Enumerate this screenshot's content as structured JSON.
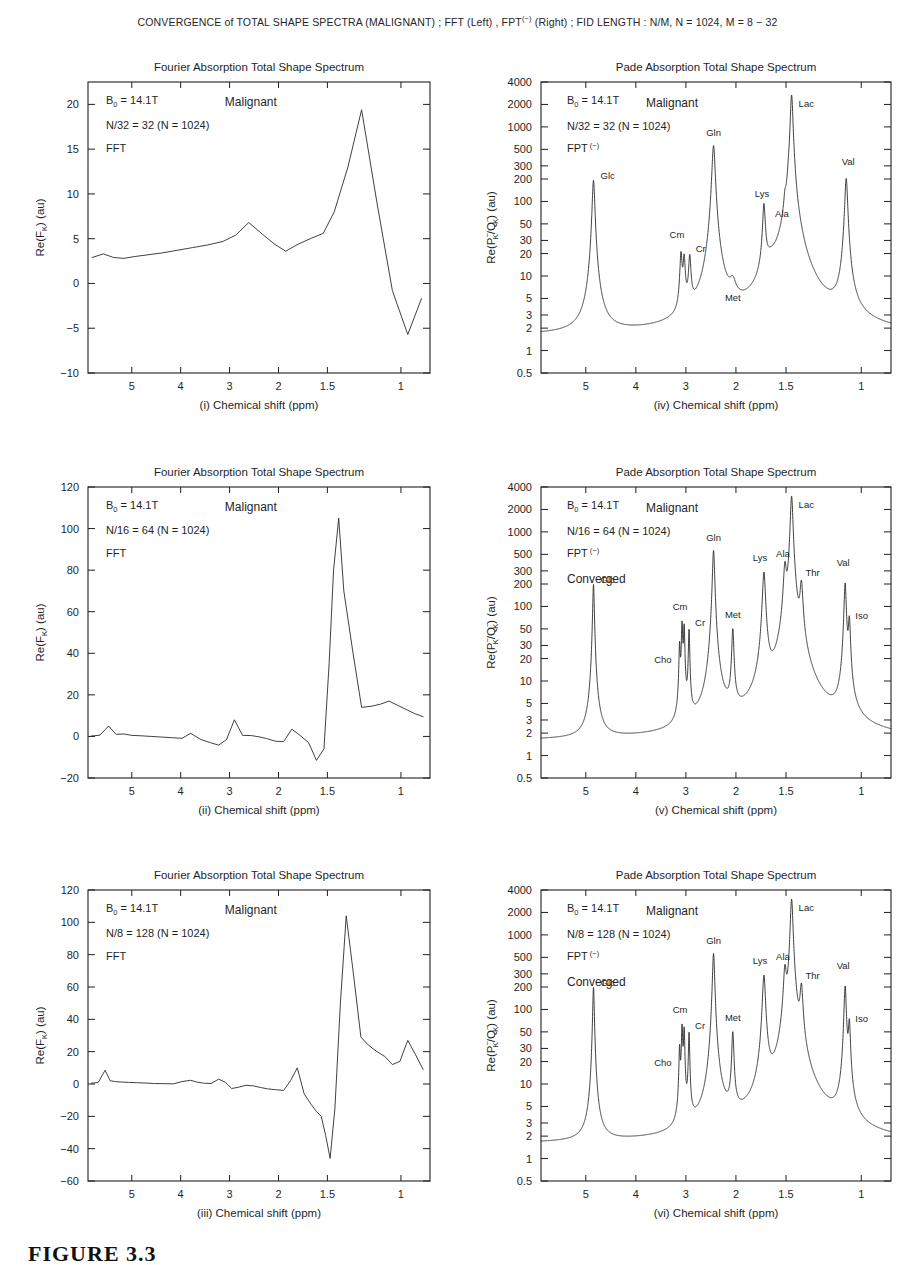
{
  "figure": {
    "suptitle_parts": {
      "a": "CONVERGENCE of TOTAL SHAPE SPECTRA (MALIGNANT) ;  FFT (Left) ,  FPT",
      "sup": "(−)",
      "b": " (Right) ;  FID LENGTH : N/M, N = 1024, M = 8 − 32"
    },
    "suptitle_plain": "CONVERGENCE of TOTAL SHAPE SPECTRA (MALIGNANT) ; FFT (Left) , FPT(-) (Right) ; FID LENGTH : N/M, N = 1024, M = 8 - 32",
    "caption": "FIGURE 3.3"
  },
  "common": {
    "fft_title": "Fourier Absorption Total Shape Spectrum",
    "pade_title": "Pade Absorption Total Shape Spectrum",
    "xlabel_tail": "Chemical shift (ppm)",
    "field_label": "B",
    "field_sub": "0",
    "field_value": " = 14.1T",
    "tissue": "Malignant",
    "fft_method": "FFT",
    "pade_method": "FPT",
    "pade_method_sup": "(−)",
    "converged": "Converged",
    "fft_ylabel_main": "Re(F",
    "fft_ylabel_sub": "K",
    "fft_ylabel_tail": ") (au)",
    "pade_ylabel_p": "Re(P",
    "pade_ylabel_psub": "K",
    "pade_ylabel_psup": "−",
    "pade_ylabel_q": "/Q",
    "pade_ylabel_qsub": "K",
    "pade_ylabel_qsup": "−",
    "pade_ylabel_tail": ") (au)",
    "xticks": [
      5,
      4,
      3,
      2,
      1.5,
      1
    ],
    "xtick_labels": [
      "5",
      "4",
      "3",
      "2",
      "1.5",
      "1"
    ],
    "xtick_pos": [
      0.128,
      0.271,
      0.414,
      0.557,
      0.7,
      0.915
    ],
    "pade_yticks": [
      4000,
      2000,
      1000,
      500,
      300,
      200,
      100,
      50,
      30,
      20,
      10,
      5,
      3,
      2,
      1,
      0.5
    ],
    "pade_ytick_labels": [
      "4000",
      "2000",
      "1000",
      "500",
      "300",
      "200",
      "100",
      "50",
      "30",
      "20",
      "10",
      "5",
      "3",
      "2",
      "1",
      "0.5"
    ]
  },
  "chart_data": [
    {
      "id": "i",
      "panel_index": "(i)",
      "type": "line",
      "side": "left",
      "title": "Fourier Absorption Total Shape Spectrum",
      "xlabel": "(i)  Chemical shift (ppm)",
      "ylabel": "Re(F_K) (au)",
      "grid": false,
      "legend": false,
      "annotations": [
        "B_0 = 14.1T",
        "Malignant",
        "N/32 = 32 (N = 1024)",
        "FFT"
      ],
      "fid_label": "N/32 = 32 (N = 1024)",
      "ylim": [
        -10,
        22.5
      ],
      "yticks": [
        -10,
        -5,
        0,
        5,
        10,
        15,
        20
      ],
      "ytick_labels": [
        "-10",
        "-5",
        "0",
        "5",
        "10",
        "15",
        "20"
      ],
      "xlim_frac": [
        0,
        1
      ],
      "points_xfrac": [
        0.012,
        0.045,
        0.075,
        0.105,
        0.135,
        0.175,
        0.215,
        0.26,
        0.305,
        0.35,
        0.395,
        0.432,
        0.47,
        0.51,
        0.545,
        0.578,
        0.615,
        0.65,
        0.688,
        0.72,
        0.76,
        0.8,
        0.845,
        0.89,
        0.935,
        0.975
      ],
      "points_y": [
        2.9,
        3.3,
        2.9,
        2.8,
        3.0,
        3.2,
        3.4,
        3.7,
        4.0,
        4.3,
        4.7,
        5.4,
        6.8,
        5.5,
        4.4,
        3.6,
        4.4,
        5.0,
        5.6,
        8.0,
        13.0,
        19.4,
        9.0,
        -0.8,
        -5.7,
        -1.7
      ]
    },
    {
      "id": "iv",
      "panel_index": "(iv)",
      "type": "line",
      "side": "right",
      "scale": "log",
      "title": "Pade Absorption Total Shape Spectrum",
      "xlabel": "(iv)  Chemical shift (ppm)",
      "ylabel": "Re(P-_K/Q-_K) (au)",
      "grid": false,
      "legend": false,
      "annotations": [
        "B_0 = 14.1T",
        "Malignant",
        "N/32 = 32 (N = 1024)",
        "FPT(-)"
      ],
      "fid_label": "N/32 = 32 (N = 1024)",
      "converged": false,
      "ylim": [
        0.5,
        4000
      ],
      "baseline": 1.55,
      "peaks": [
        {
          "name": "Glc",
          "xfrac": 0.15,
          "height": 190,
          "width": 0.0035,
          "label_dx": 7,
          "label_dy": -2,
          "label_anchor": "start"
        },
        {
          "name": "Cm",
          "xfrac": 0.4,
          "height": 16.5,
          "width": 0.003,
          "label_dx": -4,
          "label_dy": -22,
          "label_anchor": "middle"
        },
        {
          "name": "",
          "xfrac": 0.409,
          "height": 14.0,
          "width": 0.003,
          "label_dx": 0,
          "label_dy": 0,
          "label_anchor": "middle"
        },
        {
          "name": "Cr",
          "xfrac": 0.425,
          "height": 14.5,
          "width": 0.0032,
          "label_dx": 6,
          "label_dy": -12,
          "label_anchor": "start"
        },
        {
          "name": "Gln",
          "xfrac": 0.493,
          "height": 560,
          "width": 0.0042,
          "label_dx": 0,
          "label_dy": -10,
          "label_anchor": "middle"
        },
        {
          "name": "Met",
          "xfrac": 0.548,
          "height": 3.2,
          "width": 0.009,
          "label_dx": 0,
          "label_dy": -12,
          "label_anchor": "middle"
        },
        {
          "name": "Lys",
          "xfrac": 0.637,
          "height": 80,
          "width": 0.0035,
          "label_dx": -2,
          "label_dy": -12,
          "label_anchor": "middle"
        },
        {
          "name": "Ala",
          "xfrac": 0.697,
          "height": 40,
          "width": 0.0032,
          "label_dx": -3,
          "label_dy": -14,
          "label_anchor": "middle"
        },
        {
          "name": "",
          "xfrac": 0.707,
          "height": 36,
          "width": 0.003,
          "label_dx": 0,
          "label_dy": 0,
          "label_anchor": "middle"
        },
        {
          "name": "Lac",
          "xfrac": 0.716,
          "height": 2650,
          "width": 0.0035,
          "label_dx": 7,
          "label_dy": 12,
          "label_anchor": "start"
        },
        {
          "name": "Val",
          "xfrac": 0.872,
          "height": 200,
          "width": 0.0038,
          "label_dx": 2,
          "label_dy": -14,
          "label_anchor": "middle"
        }
      ],
      "broad": [
        {
          "xfrac": 0.655,
          "height": 8.0,
          "width": 0.026
        },
        {
          "xfrac": 0.7,
          "height": 9.0,
          "width": 0.022
        },
        {
          "xfrac": 0.72,
          "height": 6.0,
          "width": 0.03
        }
      ],
      "dip": {
        "xfrac": 0.62,
        "depth": 1.15,
        "width": 0.028
      }
    },
    {
      "id": "ii",
      "panel_index": "(ii)",
      "type": "line",
      "side": "left",
      "title": "Fourier Absorption Total Shape Spectrum",
      "xlabel": "(ii)  Chemical shift (ppm)",
      "ylabel": "Re(F_K) (au)",
      "grid": false,
      "legend": false,
      "annotations": [
        "B_0 = 14.1T",
        "Malignant",
        "N/16 = 64 (N = 1024)",
        "FFT"
      ],
      "fid_label": "N/16 = 64 (N = 1024)",
      "ylim": [
        -20,
        120
      ],
      "yticks": [
        -20,
        0,
        20,
        40,
        60,
        80,
        100,
        120
      ],
      "ytick_labels": [
        "-20",
        "0",
        "20",
        "40",
        "60",
        "80",
        "100",
        "120"
      ],
      "points_xfrac": [
        0.01,
        0.035,
        0.06,
        0.082,
        0.105,
        0.128,
        0.155,
        0.185,
        0.215,
        0.245,
        0.275,
        0.3,
        0.33,
        0.358,
        0.382,
        0.405,
        0.428,
        0.452,
        0.478,
        0.5,
        0.522,
        0.548,
        0.572,
        0.596,
        0.62,
        0.645,
        0.668,
        0.69,
        0.705,
        0.718,
        0.733,
        0.748,
        0.775,
        0.8,
        0.828,
        0.855,
        0.88,
        0.905,
        0.93,
        0.955,
        0.98
      ],
      "points_y": [
        0.2,
        0.6,
        5.0,
        1.0,
        1.2,
        0.5,
        0.3,
        0.0,
        -0.3,
        -0.6,
        -0.9,
        1.5,
        -1.5,
        -3.0,
        -4.2,
        -1.5,
        8.0,
        0.5,
        0.4,
        -0.2,
        -1.0,
        -2.3,
        -2.5,
        3.5,
        0.5,
        -3.0,
        -11.5,
        -6.0,
        35.0,
        80.0,
        105.0,
        70.0,
        40.0,
        14.0,
        14.5,
        15.5,
        17.0,
        15.0,
        13.0,
        11.0,
        9.5
      ]
    },
    {
      "id": "v",
      "panel_index": "(v)",
      "type": "line",
      "side": "right",
      "scale": "log",
      "title": "Pade Absorption Total Shape Spectrum",
      "xlabel": "(v)  Chemical shift (ppm)",
      "ylabel": "Re(P-_K/Q-_K) (au)",
      "grid": false,
      "legend": false,
      "annotations": [
        "B_0 = 14.1T",
        "Malignant",
        "N/16 = 64 (N = 1024)",
        "FPT(-)",
        "Converged"
      ],
      "fid_label": "N/16 = 64 (N = 1024)",
      "converged": true,
      "ylim": [
        0.5,
        4000
      ],
      "baseline": 1.55,
      "peaks": [
        {
          "name": "Glc",
          "xfrac": 0.15,
          "height": 195,
          "width": 0.0022,
          "label_dx": 7,
          "label_dy": -2,
          "label_anchor": "start"
        },
        {
          "name": "Cho",
          "xfrac": 0.396,
          "height": 27,
          "width": 0.0018,
          "label_dx": -8,
          "label_dy": 14,
          "label_anchor": "end"
        },
        {
          "name": "Cm",
          "xfrac": 0.403,
          "height": 55,
          "width": 0.0018,
          "label_dx": -2,
          "label_dy": -16,
          "label_anchor": "middle"
        },
        {
          "name": "",
          "xfrac": 0.409,
          "height": 50,
          "width": 0.0018,
          "label_dx": 0,
          "label_dy": 0,
          "label_anchor": "middle"
        },
        {
          "name": "Cr",
          "xfrac": 0.423,
          "height": 45,
          "width": 0.0018,
          "label_dx": 6,
          "label_dy": -6,
          "label_anchor": "start"
        },
        {
          "name": "Gln",
          "xfrac": 0.493,
          "height": 560,
          "width": 0.003,
          "label_dx": 0,
          "label_dy": -10,
          "label_anchor": "middle"
        },
        {
          "name": "Met",
          "xfrac": 0.548,
          "height": 45,
          "width": 0.0028,
          "label_dx": 0,
          "label_dy": -14,
          "label_anchor": "middle"
        },
        {
          "name": "Lys",
          "xfrac": 0.637,
          "height": 280,
          "width": 0.004,
          "label_dx": -4,
          "label_dy": -12,
          "label_anchor": "middle"
        },
        {
          "name": "Ala",
          "xfrac": 0.697,
          "height": 300,
          "width": 0.004,
          "label_dx": -2,
          "label_dy": -14,
          "label_anchor": "middle"
        },
        {
          "name": "Lac",
          "xfrac": 0.716,
          "height": 3000,
          "width": 0.0035,
          "label_dx": 7,
          "label_dy": 12,
          "label_anchor": "start"
        },
        {
          "name": "Thr",
          "xfrac": 0.744,
          "height": 175,
          "width": 0.004,
          "label_dx": 4,
          "label_dy": -12,
          "label_anchor": "start"
        },
        {
          "name": "Val",
          "xfrac": 0.869,
          "height": 200,
          "width": 0.003,
          "label_dx": -2,
          "label_dy": -18,
          "label_anchor": "middle"
        },
        {
          "name": "Iso",
          "xfrac": 0.881,
          "height": 60,
          "width": 0.0028,
          "label_dx": 6,
          "label_dy": -4,
          "label_anchor": "start"
        }
      ],
      "broad": [],
      "dip": null
    },
    {
      "id": "iii",
      "panel_index": "(iii)",
      "type": "line",
      "side": "left",
      "title": "Fourier Absorption Total Shape Spectrum",
      "xlabel": "(iii)  Chemical shift (ppm)",
      "ylabel": "Re(F_K) (au)",
      "grid": false,
      "legend": false,
      "annotations": [
        "B_0 = 14.1T",
        "Malignant",
        "N/8 = 128 (N = 1024)",
        "FFT"
      ],
      "fid_label": "N/8 = 128 (N = 1024)",
      "ylim": [
        -60,
        120
      ],
      "yticks": [
        -60,
        -40,
        -20,
        0,
        20,
        40,
        60,
        80,
        100,
        120
      ],
      "ytick_labels": [
        "-60",
        "-40",
        "-20",
        "0",
        "20",
        "40",
        "60",
        "80",
        "100",
        "120"
      ],
      "points_xfrac": [
        0.01,
        0.03,
        0.05,
        0.065,
        0.08,
        0.098,
        0.118,
        0.142,
        0.168,
        0.195,
        0.222,
        0.25,
        0.275,
        0.3,
        0.318,
        0.338,
        0.36,
        0.382,
        0.402,
        0.42,
        0.44,
        0.462,
        0.485,
        0.505,
        0.525,
        0.548,
        0.572,
        0.592,
        0.612,
        0.632,
        0.652,
        0.668,
        0.682,
        0.695,
        0.708,
        0.722,
        0.738,
        0.755,
        0.775,
        0.798,
        0.82,
        0.845,
        0.868,
        0.89,
        0.912,
        0.935,
        0.958,
        0.98
      ],
      "points_y": [
        0.5,
        1.0,
        8.5,
        2.0,
        1.5,
        1.2,
        1.0,
        0.8,
        0.6,
        0.3,
        0.2,
        0.1,
        1.5,
        2.3,
        1.2,
        0.5,
        0.3,
        3.0,
        1.0,
        -2.8,
        -2.0,
        -0.8,
        -1.2,
        -2.2,
        -3.0,
        -3.5,
        -4.0,
        2.0,
        10.0,
        -6.0,
        -12.5,
        -17.0,
        -20.0,
        -32.0,
        -46.0,
        -15.0,
        50.0,
        104.0,
        70.0,
        29.0,
        24.0,
        20.0,
        17.0,
        12.0,
        14.0,
        27.0,
        18.0,
        9.0
      ]
    },
    {
      "id": "vi",
      "panel_index": "(vi)",
      "type": "line",
      "side": "right",
      "scale": "log",
      "title": "Pade Absorption Total Shape Spectrum",
      "xlabel": "(vi)  Chemical shift (ppm)",
      "ylabel": "Re(P-_K/Q-_K) (au)",
      "grid": false,
      "legend": false,
      "annotations": [
        "B_0 = 14.1T",
        "Malignant",
        "N/8 = 128 (N = 1024)",
        "FPT(-)",
        "Converged"
      ],
      "fid_label": "N/8 = 128 (N = 1024)",
      "converged": true,
      "ylim": [
        0.5,
        4000
      ],
      "baseline": 1.55,
      "peaks": [
        {
          "name": "Glc",
          "xfrac": 0.15,
          "height": 195,
          "width": 0.0022,
          "label_dx": 7,
          "label_dy": -2,
          "label_anchor": "start"
        },
        {
          "name": "Cho",
          "xfrac": 0.396,
          "height": 27,
          "width": 0.0018,
          "label_dx": -8,
          "label_dy": 14,
          "label_anchor": "end"
        },
        {
          "name": "Cm",
          "xfrac": 0.403,
          "height": 55,
          "width": 0.0018,
          "label_dx": -2,
          "label_dy": -16,
          "label_anchor": "middle"
        },
        {
          "name": "",
          "xfrac": 0.409,
          "height": 50,
          "width": 0.0018,
          "label_dx": 0,
          "label_dy": 0,
          "label_anchor": "middle"
        },
        {
          "name": "Cr",
          "xfrac": 0.423,
          "height": 45,
          "width": 0.0018,
          "label_dx": 6,
          "label_dy": -6,
          "label_anchor": "start"
        },
        {
          "name": "Gln",
          "xfrac": 0.493,
          "height": 560,
          "width": 0.003,
          "label_dx": 0,
          "label_dy": -10,
          "label_anchor": "middle"
        },
        {
          "name": "Met",
          "xfrac": 0.548,
          "height": 45,
          "width": 0.0028,
          "label_dx": 0,
          "label_dy": -14,
          "label_anchor": "middle"
        },
        {
          "name": "Lys",
          "xfrac": 0.637,
          "height": 280,
          "width": 0.004,
          "label_dx": -4,
          "label_dy": -12,
          "label_anchor": "middle"
        },
        {
          "name": "Ala",
          "xfrac": 0.697,
          "height": 300,
          "width": 0.004,
          "label_dx": -2,
          "label_dy": -14,
          "label_anchor": "middle"
        },
        {
          "name": "Lac",
          "xfrac": 0.716,
          "height": 3000,
          "width": 0.0035,
          "label_dx": 7,
          "label_dy": 12,
          "label_anchor": "start"
        },
        {
          "name": "Thr",
          "xfrac": 0.744,
          "height": 175,
          "width": 0.004,
          "label_dx": 4,
          "label_dy": -12,
          "label_anchor": "start"
        },
        {
          "name": "Val",
          "xfrac": 0.869,
          "height": 200,
          "width": 0.003,
          "label_dx": -2,
          "label_dy": -18,
          "label_anchor": "middle"
        },
        {
          "name": "Iso",
          "xfrac": 0.881,
          "height": 60,
          "width": 0.0028,
          "label_dx": 6,
          "label_dy": -4,
          "label_anchor": "start"
        }
      ],
      "broad": [],
      "dip": null
    }
  ]
}
